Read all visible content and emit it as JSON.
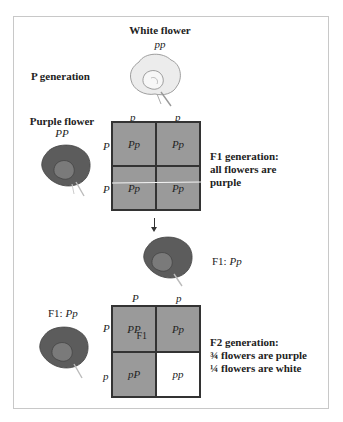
{
  "parents": {
    "generation_label": "P generation",
    "white": {
      "label": "White flower",
      "genotype": "pp"
    },
    "purple": {
      "label": "Purple flower",
      "genotype": "PP"
    }
  },
  "cross1": {
    "col_headers": [
      "p",
      "p"
    ],
    "row_headers": [
      "P",
      "P"
    ],
    "cells": [
      "Pp",
      "Pp",
      "Pp",
      "Pp"
    ],
    "caption_line1": "F1 generation:",
    "caption_line2": "all flowers are",
    "caption_line3": "purple"
  },
  "f1_offspring": {
    "label_prefix": "F1: ",
    "genotype": "Pp"
  },
  "cross2": {
    "left_label_prefix": "F1: ",
    "left_genotype": "Pp",
    "col_headers": [
      "P",
      "p"
    ],
    "row_headers": [
      "P",
      "p"
    ],
    "cells": [
      "PP",
      "Pp",
      "pP",
      "pp"
    ],
    "cell_tag": "F1",
    "caption_line1": "F2 generation:",
    "caption_line2": "¾ flowers are purple",
    "caption_line3": "¼ flowers are white"
  },
  "colors": {
    "purple_cell": "#9a9a9a",
    "white_cell": "#ffffff",
    "purple_flower": "#5c5c5c",
    "white_flower": "#ececec"
  }
}
